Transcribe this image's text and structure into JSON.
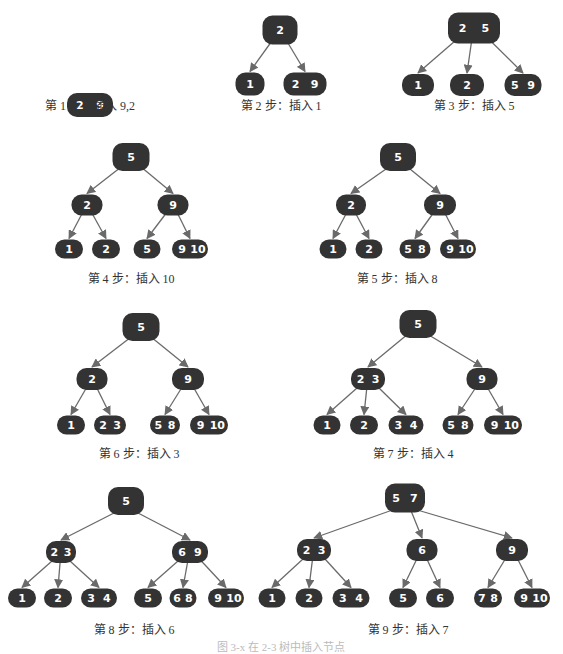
{
  "figure": {
    "caption": "图 3-x 在 2-3 树中插入节点",
    "colors": {
      "node_fill": "#333333",
      "node_text": "#ffffff",
      "edge": "#6a6a6a",
      "label_text": "#333333"
    }
  },
  "steps": [
    {
      "label": "第 1 步：插入 9,2",
      "label_pos": [
        90,
        104
      ],
      "nodes": [
        {
          "id": "a",
          "keys": [
            "2",
            "9"
          ],
          "x": 90,
          "y": 105,
          "w": 46,
          "h": 24
        }
      ],
      "edges": []
    },
    {
      "label": "第 2 步：插入 1",
      "label_pos": [
        281,
        104
      ],
      "nodes": [
        {
          "id": "r",
          "keys": [
            "2"
          ],
          "x": 280,
          "y": 30,
          "w": 35,
          "h": 29
        },
        {
          "id": "l",
          "keys": [
            "1"
          ],
          "x": 250,
          "y": 84,
          "w": 29,
          "h": 23
        },
        {
          "id": "m",
          "keys": [
            "2",
            "9"
          ],
          "x": 305,
          "y": 84,
          "w": 43,
          "h": 23
        }
      ],
      "edges": [
        [
          "r",
          "l"
        ],
        [
          "r",
          "m"
        ]
      ]
    },
    {
      "label": "第 3 步：插入 5",
      "label_pos": [
        474,
        104
      ],
      "nodes": [
        {
          "id": "r",
          "keys": [
            "2",
            "5"
          ],
          "x": 474,
          "y": 28,
          "w": 52,
          "h": 31
        },
        {
          "id": "a",
          "keys": [
            "1"
          ],
          "x": 418,
          "y": 85,
          "w": 32,
          "h": 22
        },
        {
          "id": "b",
          "keys": [
            "2"
          ],
          "x": 467,
          "y": 85,
          "w": 34,
          "h": 22
        },
        {
          "id": "c",
          "keys": [
            "5",
            "9"
          ],
          "x": 523,
          "y": 85,
          "w": 37,
          "h": 22
        }
      ],
      "edges": [
        [
          "r",
          "a"
        ],
        [
          "r",
          "b"
        ],
        [
          "r",
          "c"
        ]
      ]
    },
    {
      "label": "第 4 步：插入 10",
      "label_pos": [
        131,
        277
      ],
      "nodes": [
        {
          "id": "r",
          "keys": [
            "5"
          ],
          "x": 131,
          "y": 157,
          "w": 37,
          "h": 28
        },
        {
          "id": "a",
          "keys": [
            "2"
          ],
          "x": 87,
          "y": 205,
          "w": 31,
          "h": 21
        },
        {
          "id": "b",
          "keys": [
            "9"
          ],
          "x": 173,
          "y": 205,
          "w": 31,
          "h": 21
        },
        {
          "id": "c",
          "keys": [
            "1"
          ],
          "x": 69,
          "y": 249,
          "w": 28,
          "h": 19
        },
        {
          "id": "d",
          "keys": [
            "2"
          ],
          "x": 106,
          "y": 249,
          "w": 28,
          "h": 19
        },
        {
          "id": "e",
          "keys": [
            "5"
          ],
          "x": 147,
          "y": 249,
          "w": 27,
          "h": 19
        },
        {
          "id": "f",
          "keys": [
            "9",
            "10"
          ],
          "x": 190,
          "y": 249,
          "w": 36,
          "h": 19
        }
      ],
      "edges": [
        [
          "r",
          "a"
        ],
        [
          "r",
          "b"
        ],
        [
          "a",
          "c"
        ],
        [
          "a",
          "d"
        ],
        [
          "b",
          "e"
        ],
        [
          "b",
          "f"
        ]
      ]
    },
    {
      "label": "第 5 步：插入 8",
      "label_pos": [
        397,
        277
      ],
      "nodes": [
        {
          "id": "r",
          "keys": [
            "5"
          ],
          "x": 398,
          "y": 157,
          "w": 36,
          "h": 28
        },
        {
          "id": "a",
          "keys": [
            "2"
          ],
          "x": 351,
          "y": 205,
          "w": 30,
          "h": 21
        },
        {
          "id": "b",
          "keys": [
            "9"
          ],
          "x": 440,
          "y": 205,
          "w": 32,
          "h": 21
        },
        {
          "id": "c",
          "keys": [
            "1"
          ],
          "x": 333,
          "y": 249,
          "w": 27,
          "h": 19
        },
        {
          "id": "d",
          "keys": [
            "2"
          ],
          "x": 369,
          "y": 249,
          "w": 27,
          "h": 19
        },
        {
          "id": "e",
          "keys": [
            "5",
            "8"
          ],
          "x": 415,
          "y": 249,
          "w": 31,
          "h": 19
        },
        {
          "id": "f",
          "keys": [
            "9",
            "10"
          ],
          "x": 458,
          "y": 249,
          "w": 36,
          "h": 19
        }
      ],
      "edges": [
        [
          "r",
          "a"
        ],
        [
          "r",
          "b"
        ],
        [
          "a",
          "c"
        ],
        [
          "a",
          "d"
        ],
        [
          "b",
          "e"
        ],
        [
          "b",
          "f"
        ]
      ]
    },
    {
      "label": "第 6 步：插入 3",
      "label_pos": [
        139,
        452
      ],
      "nodes": [
        {
          "id": "r",
          "keys": [
            "5"
          ],
          "x": 141,
          "y": 327,
          "w": 37,
          "h": 28
        },
        {
          "id": "a",
          "keys": [
            "2"
          ],
          "x": 92,
          "y": 379,
          "w": 31,
          "h": 22
        },
        {
          "id": "b",
          "keys": [
            "9"
          ],
          "x": 188,
          "y": 379,
          "w": 32,
          "h": 22
        },
        {
          "id": "c",
          "keys": [
            "1"
          ],
          "x": 71,
          "y": 425,
          "w": 28,
          "h": 19
        },
        {
          "id": "d",
          "keys": [
            "2",
            "3"
          ],
          "x": 110,
          "y": 425,
          "w": 32,
          "h": 19
        },
        {
          "id": "e",
          "keys": [
            "5",
            "8"
          ],
          "x": 165,
          "y": 425,
          "w": 30,
          "h": 19
        },
        {
          "id": "f",
          "keys": [
            "9",
            "10"
          ],
          "x": 209,
          "y": 425,
          "w": 38,
          "h": 19
        }
      ],
      "edges": [
        [
          "r",
          "a"
        ],
        [
          "r",
          "b"
        ],
        [
          "a",
          "c"
        ],
        [
          "a",
          "d"
        ],
        [
          "b",
          "e"
        ],
        [
          "b",
          "f"
        ]
      ]
    },
    {
      "label": "第 7 步：插入 4",
      "label_pos": [
        413,
        452
      ],
      "nodes": [
        {
          "id": "r",
          "keys": [
            "5"
          ],
          "x": 418,
          "y": 324,
          "w": 37,
          "h": 28
        },
        {
          "id": "a",
          "keys": [
            "2",
            "3"
          ],
          "x": 368,
          "y": 379,
          "w": 34,
          "h": 22
        },
        {
          "id": "b",
          "keys": [
            "9"
          ],
          "x": 482,
          "y": 379,
          "w": 31,
          "h": 22
        },
        {
          "id": "c",
          "keys": [
            "1"
          ],
          "x": 327,
          "y": 425,
          "w": 27,
          "h": 19
        },
        {
          "id": "d",
          "keys": [
            "2"
          ],
          "x": 364,
          "y": 425,
          "w": 28,
          "h": 19
        },
        {
          "id": "e",
          "keys": [
            "3",
            "4"
          ],
          "x": 406,
          "y": 425,
          "w": 35,
          "h": 19
        },
        {
          "id": "f",
          "keys": [
            "5",
            "8"
          ],
          "x": 458,
          "y": 425,
          "w": 31,
          "h": 19
        },
        {
          "id": "g",
          "keys": [
            "9",
            "10"
          ],
          "x": 503,
          "y": 425,
          "w": 38,
          "h": 19
        }
      ],
      "edges": [
        [
          "r",
          "a"
        ],
        [
          "r",
          "b"
        ],
        [
          "a",
          "c"
        ],
        [
          "a",
          "d"
        ],
        [
          "a",
          "e"
        ],
        [
          "b",
          "f"
        ],
        [
          "b",
          "g"
        ]
      ]
    },
    {
      "label": "第 8 步：插入 6",
      "label_pos": [
        134,
        628
      ],
      "nodes": [
        {
          "id": "r",
          "keys": [
            "5"
          ],
          "x": 126,
          "y": 501,
          "w": 36,
          "h": 28
        },
        {
          "id": "a",
          "keys": [
            "2",
            "3"
          ],
          "x": 61,
          "y": 552,
          "w": 30,
          "h": 22
        },
        {
          "id": "b",
          "keys": [
            "6",
            "9"
          ],
          "x": 190,
          "y": 552,
          "w": 36,
          "h": 22
        },
        {
          "id": "c",
          "keys": [
            "1"
          ],
          "x": 22,
          "y": 598,
          "w": 28,
          "h": 19
        },
        {
          "id": "d",
          "keys": [
            "2"
          ],
          "x": 58,
          "y": 598,
          "w": 28,
          "h": 19
        },
        {
          "id": "e",
          "keys": [
            "3",
            "4"
          ],
          "x": 99,
          "y": 598,
          "w": 36,
          "h": 19
        },
        {
          "id": "f",
          "keys": [
            "5"
          ],
          "x": 148,
          "y": 598,
          "w": 28,
          "h": 19
        },
        {
          "id": "g",
          "keys": [
            "6",
            "8"
          ],
          "x": 183,
          "y": 598,
          "w": 27,
          "h": 19
        },
        {
          "id": "h",
          "keys": [
            "9",
            "10"
          ],
          "x": 226,
          "y": 598,
          "w": 36,
          "h": 19
        }
      ],
      "edges": [
        [
          "r",
          "a"
        ],
        [
          "r",
          "b"
        ],
        [
          "a",
          "c"
        ],
        [
          "a",
          "d"
        ],
        [
          "a",
          "e"
        ],
        [
          "b",
          "f"
        ],
        [
          "b",
          "g"
        ],
        [
          "b",
          "h"
        ]
      ]
    },
    {
      "label": "第 9 步：插入 7",
      "label_pos": [
        408,
        628
      ],
      "nodes": [
        {
          "id": "r",
          "keys": [
            "5",
            "7"
          ],
          "x": 405,
          "y": 498,
          "w": 40,
          "h": 29
        },
        {
          "id": "a",
          "keys": [
            "2",
            "3"
          ],
          "x": 314,
          "y": 550,
          "w": 34,
          "h": 22
        },
        {
          "id": "b",
          "keys": [
            "6"
          ],
          "x": 422,
          "y": 550,
          "w": 31,
          "h": 22
        },
        {
          "id": "c",
          "keys": [
            "9"
          ],
          "x": 512,
          "y": 550,
          "w": 32,
          "h": 22
        },
        {
          "id": "d",
          "keys": [
            "1"
          ],
          "x": 272,
          "y": 598,
          "w": 27,
          "h": 19
        },
        {
          "id": "e",
          "keys": [
            "2"
          ],
          "x": 309,
          "y": 598,
          "w": 27,
          "h": 19
        },
        {
          "id": "f",
          "keys": [
            "3",
            "4"
          ],
          "x": 351,
          "y": 598,
          "w": 37,
          "h": 19
        },
        {
          "id": "g",
          "keys": [
            "5"
          ],
          "x": 403,
          "y": 598,
          "w": 28,
          "h": 19
        },
        {
          "id": "h",
          "keys": [
            "6"
          ],
          "x": 440,
          "y": 598,
          "w": 28,
          "h": 19
        },
        {
          "id": "i",
          "keys": [
            "7",
            "8"
          ],
          "x": 488,
          "y": 598,
          "w": 28,
          "h": 19
        },
        {
          "id": "j",
          "keys": [
            "9",
            "10"
          ],
          "x": 532,
          "y": 598,
          "w": 36,
          "h": 19
        }
      ],
      "edges": [
        [
          "r",
          "a"
        ],
        [
          "r",
          "b"
        ],
        [
          "r",
          "c"
        ],
        [
          "a",
          "d"
        ],
        [
          "a",
          "e"
        ],
        [
          "a",
          "f"
        ],
        [
          "b",
          "g"
        ],
        [
          "b",
          "h"
        ],
        [
          "c",
          "i"
        ],
        [
          "c",
          "j"
        ]
      ]
    }
  ]
}
